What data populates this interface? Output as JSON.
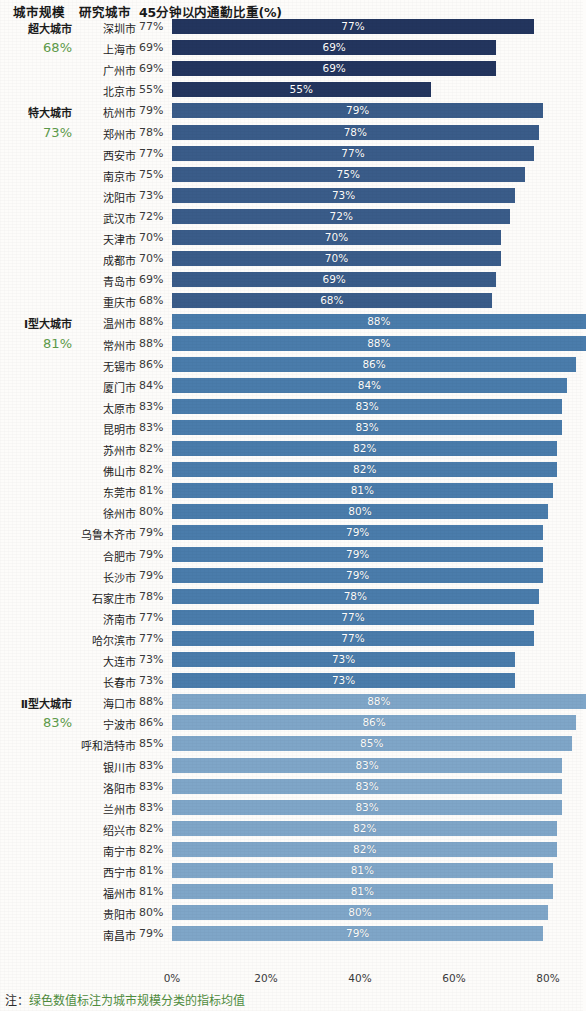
{
  "header": {
    "scale_col": "城市规模",
    "city_col": "研究城市",
    "metric_col": "45分钟以内通勤比重(%)"
  },
  "note": {
    "prefix": "注：",
    "text": "绿色数值标注为城市规模分类的指标均值"
  },
  "axis": {
    "ticks": [
      "0%",
      "20%",
      "40%",
      "60%",
      "80%"
    ],
    "tick_values": [
      0,
      20,
      40,
      60,
      80
    ],
    "min": 0,
    "max": 80
  },
  "colors": {
    "group_1": "#23355e",
    "group_2": "#3a5c89",
    "group_3": "#4a7cab",
    "group_4": "#7fa6c8",
    "average_text": "#5d9b4a",
    "note_text": "#4f8c3d",
    "background": "#fdfcfa"
  },
  "chart_data": {
    "type": "bar",
    "orientation": "horizontal",
    "title": "45分钟以内通勤比重(%)",
    "xlabel": "",
    "ylabel": "",
    "xlim": [
      0,
      80
    ],
    "grid": false,
    "legend": null,
    "value_suffix": "%",
    "groups": [
      {
        "name": "超大城市",
        "average": "68%",
        "average_value": 68,
        "color": "#23355e",
        "categories": [
          "深圳市",
          "上海市",
          "广州市",
          "北京市"
        ],
        "values": [
          77,
          69,
          69,
          55
        ],
        "labels": [
          "77%",
          "69%",
          "69%",
          "55%"
        ]
      },
      {
        "name": "特大城市",
        "average": "73%",
        "average_value": 73,
        "color": "#3a5c89",
        "categories": [
          "杭州市",
          "郑州市",
          "西安市",
          "南京市",
          "沈阳市",
          "武汉市",
          "天津市",
          "成都市",
          "青岛市",
          "重庆市"
        ],
        "values": [
          79,
          78,
          77,
          75,
          73,
          72,
          70,
          70,
          69,
          68
        ],
        "labels": [
          "79%",
          "78%",
          "77%",
          "75%",
          "73%",
          "72%",
          "70%",
          "70%",
          "69%",
          "68%"
        ]
      },
      {
        "name": "Ⅰ型大城市",
        "average": "81%",
        "average_value": 81,
        "color": "#4a7cab",
        "categories": [
          "温州市",
          "常州市",
          "无锡市",
          "厦门市",
          "太原市",
          "昆明市",
          "苏州市",
          "佛山市",
          "东莞市",
          "徐州市",
          "乌鲁木齐市",
          "合肥市",
          "长沙市",
          "石家庄市",
          "济南市",
          "哈尔滨市",
          "大连市",
          "长春市"
        ],
        "values": [
          88,
          88,
          86,
          84,
          83,
          83,
          82,
          82,
          81,
          80,
          79,
          79,
          79,
          78,
          77,
          77,
          73,
          73
        ],
        "labels": [
          "88%",
          "88%",
          "86%",
          "84%",
          "83%",
          "83%",
          "82%",
          "82%",
          "81%",
          "80%",
          "79%",
          "79%",
          "79%",
          "78%",
          "77%",
          "77%",
          "73%",
          "73%"
        ]
      },
      {
        "name": "Ⅱ型大城市",
        "average": "83%",
        "average_value": 83,
        "color": "#7fa6c8",
        "categories": [
          "海口市",
          "宁波市",
          "呼和浩特市",
          "银川市",
          "洛阳市",
          "兰州市",
          "绍兴市",
          "南宁市",
          "西宁市",
          "福州市",
          "贵阳市",
          "南昌市"
        ],
        "values": [
          88,
          86,
          85,
          83,
          83,
          83,
          82,
          82,
          81,
          81,
          80,
          79
        ],
        "labels": [
          "88%",
          "86%",
          "85%",
          "83%",
          "83%",
          "83%",
          "82%",
          "82%",
          "81%",
          "81%",
          "80%",
          "79%"
        ]
      }
    ]
  }
}
